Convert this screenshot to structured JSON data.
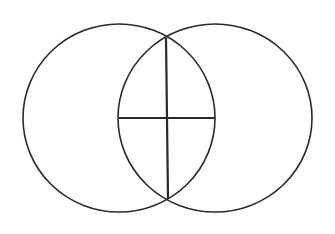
{
  "diagram": {
    "type": "vesica-piscis",
    "background": "#ffffff",
    "stroke_color": "#2a2a2a",
    "circles": [
      {
        "name": "left-circle",
        "cx": 119,
        "cy": 118,
        "rx": 96,
        "ry": 94,
        "stroke_width": 1.6
      },
      {
        "name": "right-circle",
        "cx": 215,
        "cy": 118,
        "rx": 97,
        "ry": 94,
        "stroke_width": 1.6
      }
    ],
    "lines": [
      {
        "name": "vertical-chord",
        "x1": 166,
        "y1": 38,
        "x2": 168,
        "y2": 199,
        "stroke_width": 2.2
      },
      {
        "name": "horizontal-center-line",
        "x1": 119,
        "y1": 118,
        "x2": 215,
        "y2": 118,
        "stroke_width": 2.2
      }
    ]
  }
}
